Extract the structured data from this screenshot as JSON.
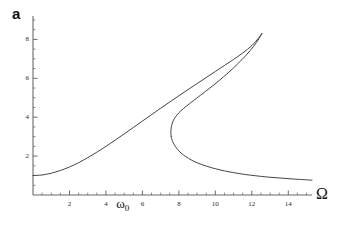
{
  "figure": {
    "panel_label": "a",
    "background": "#ffffff",
    "curve_color": "#3a3a3a",
    "axis_color": "#6b6b6b"
  },
  "annotations": {
    "omega0_label": "ω",
    "omega0_sub": "0",
    "omega0_at_x": 5.0
  },
  "chart_data": {
    "type": "line",
    "title": "",
    "subtitle": "",
    "xlabel": "Ω",
    "ylabel": "a",
    "grid": false,
    "legend": null,
    "xlim": [
      0,
      15.3
    ],
    "ylim": [
      0,
      9.1
    ],
    "xticks": [
      2,
      4,
      6,
      8,
      10,
      12,
      14
    ],
    "xticklabels": [
      "2",
      "4",
      "6",
      "8",
      "10",
      "12",
      "14"
    ],
    "yticks": [
      2,
      4,
      6,
      8
    ],
    "yticklabels": [
      "2",
      "4",
      "6",
      "8"
    ],
    "xminor_step": 0.5,
    "yminor_step": 0.5,
    "series": [
      {
        "name": "upper-branch",
        "comment": "Stable upper branch rising from a~1 at Omega=0 to the cusp.",
        "points": [
          [
            0.0,
            1.0
          ],
          [
            0.5,
            1.03
          ],
          [
            1.0,
            1.12
          ],
          [
            1.5,
            1.26
          ],
          [
            2.0,
            1.44
          ],
          [
            2.5,
            1.66
          ],
          [
            3.0,
            1.92
          ],
          [
            3.5,
            2.2
          ],
          [
            4.0,
            2.5
          ],
          [
            4.5,
            2.82
          ],
          [
            5.0,
            3.14
          ],
          [
            5.5,
            3.47
          ],
          [
            6.0,
            3.8
          ],
          [
            6.5,
            4.13
          ],
          [
            7.0,
            4.46
          ],
          [
            7.5,
            4.78
          ],
          [
            8.0,
            5.1
          ],
          [
            8.5,
            5.42
          ],
          [
            9.0,
            5.73
          ],
          [
            9.5,
            6.04
          ],
          [
            10.0,
            6.35
          ],
          [
            10.5,
            6.66
          ],
          [
            11.0,
            6.97
          ],
          [
            11.5,
            7.3
          ],
          [
            12.0,
            7.68
          ],
          [
            12.35,
            8.05
          ],
          [
            12.55,
            8.3
          ]
        ]
      },
      {
        "name": "middle-branch",
        "comment": "Unstable middle branch descending from the cusp back to the lower fold.",
        "points": [
          [
            12.55,
            8.3
          ],
          [
            12.4,
            8.05
          ],
          [
            12.1,
            7.65
          ],
          [
            11.7,
            7.2
          ],
          [
            11.2,
            6.72
          ],
          [
            10.7,
            6.28
          ],
          [
            10.2,
            5.88
          ],
          [
            9.7,
            5.5
          ],
          [
            9.2,
            5.14
          ],
          [
            8.8,
            4.85
          ],
          [
            8.4,
            4.56
          ],
          [
            8.1,
            4.32
          ],
          [
            7.9,
            4.12
          ],
          [
            7.75,
            3.92
          ],
          [
            7.64,
            3.7
          ],
          [
            7.58,
            3.45
          ],
          [
            7.56,
            3.2
          ],
          [
            7.58,
            3.0
          ]
        ]
      },
      {
        "name": "lower-branch",
        "comment": "Stable lower branch from the fold decaying toward the axis at large Omega.",
        "points": [
          [
            7.58,
            3.0
          ],
          [
            7.66,
            2.74
          ],
          [
            7.82,
            2.48
          ],
          [
            8.05,
            2.22
          ],
          [
            8.35,
            1.99
          ],
          [
            8.7,
            1.79
          ],
          [
            9.1,
            1.62
          ],
          [
            9.55,
            1.47
          ],
          [
            10.0,
            1.35
          ],
          [
            10.5,
            1.24
          ],
          [
            11.0,
            1.15
          ],
          [
            11.6,
            1.06
          ],
          [
            12.2,
            0.99
          ],
          [
            12.9,
            0.92
          ],
          [
            13.6,
            0.87
          ],
          [
            14.3,
            0.82
          ],
          [
            15.0,
            0.78
          ],
          [
            15.3,
            0.76
          ]
        ]
      }
    ]
  }
}
